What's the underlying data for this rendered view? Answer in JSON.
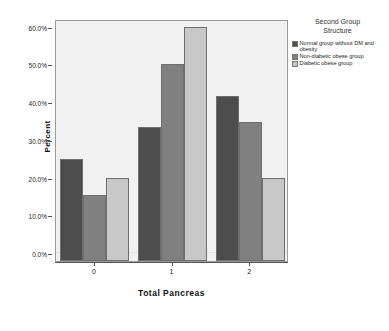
{
  "chart_data": {
    "type": "bar",
    "title": "",
    "xlabel": "Total Pancreas",
    "ylabel": "Percent",
    "categories": [
      "0",
      "1",
      "2"
    ],
    "ylim": [
      0,
      62
    ],
    "ytick_values": [
      0,
      10,
      20,
      30,
      40,
      50,
      60
    ],
    "ytick_labels": [
      "0.0%",
      "10.0%",
      "20.0%",
      "30.0%",
      "40.0%",
      "50.0%",
      "60.0%"
    ],
    "grid": false,
    "legend_position": "right",
    "legend_title": "Second Group Structure",
    "series": [
      {
        "name": "Normal group without DM and obesity",
        "color": "#4d4d4d",
        "values": [
          25.0,
          33.3,
          41.7
        ]
      },
      {
        "name": "Non-diabetic obese group",
        "color": "#808080",
        "values": [
          15.4,
          50.0,
          34.6
        ]
      },
      {
        "name": "Diabetic obese group",
        "color": "#c8c8c8",
        "values": [
          20.0,
          60.0,
          20.0
        ]
      }
    ]
  },
  "legend": {
    "title_line1": "Second Group",
    "title_line2": "Structure"
  },
  "colors": {
    "plot_background": "#f1f1f1",
    "axis": "#555555",
    "series1": "#4d4d4d",
    "series2": "#808080",
    "series3": "#c8c8c8"
  }
}
